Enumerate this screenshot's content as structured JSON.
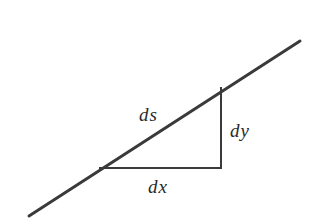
{
  "diagram": {
    "colors": {
      "background": "#ffffff",
      "line": "#3a3a3a",
      "text": "#2a2a2a"
    },
    "curve_line": {
      "x1": 29,
      "y1": 216,
      "x2": 300,
      "y2": 41,
      "stroke_width": 3
    },
    "triangle": {
      "bottom_left": [
        100,
        168
      ],
      "corner": [
        221,
        168
      ],
      "top_right": [
        221,
        88
      ],
      "stroke_width": 2
    },
    "labels": {
      "ds": {
        "text": "ds",
        "x": 139,
        "y": 121
      },
      "dy": {
        "text": "dy",
        "x": 230,
        "y": 137
      },
      "dx": {
        "text": "dx",
        "x": 148,
        "y": 193
      }
    }
  }
}
